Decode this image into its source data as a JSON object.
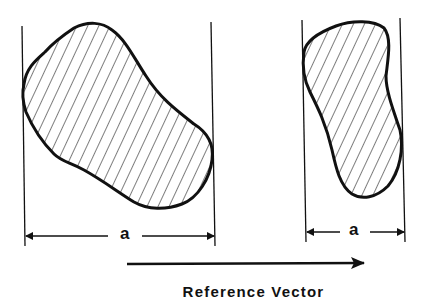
{
  "diagram": {
    "left_figure": {
      "dimension_label": "a"
    },
    "right_figure": {
      "dimension_label": "a"
    },
    "arrow": {
      "direction": "right"
    },
    "caption": "Reference Vector"
  }
}
